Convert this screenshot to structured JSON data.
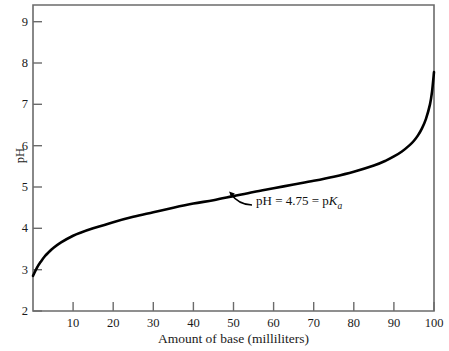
{
  "chart_data": {
    "type": "line",
    "title": "",
    "xlabel": "Amount of base (milliliters)",
    "ylabel": "pH",
    "xlim": [
      0,
      100
    ],
    "ylim": [
      2,
      9.4
    ],
    "grid": false,
    "legend": null,
    "xticks": [
      10,
      20,
      30,
      40,
      50,
      60,
      70,
      80,
      90,
      100
    ],
    "yticks": [
      2,
      3,
      4,
      5,
      6,
      7,
      8,
      9
    ],
    "xtick_labels": [
      "10",
      "20",
      "30",
      "40",
      "50",
      "60",
      "70",
      "80",
      "90",
      "100"
    ],
    "ytick_labels": [
      "2",
      "3",
      "4",
      "5",
      "6",
      "7",
      "8",
      "9"
    ],
    "series": [
      {
        "name": "titration-curve",
        "color": "#000000",
        "x": [
          0,
          1,
          2,
          3,
          4,
          5,
          7,
          10,
          12,
          15,
          20,
          25,
          30,
          35,
          40,
          45,
          50,
          55,
          60,
          65,
          70,
          75,
          80,
          85,
          88,
          90,
          92,
          94,
          95,
          96,
          97,
          98,
          99,
          99.5,
          100
        ],
        "y": [
          2.85,
          3.05,
          3.2,
          3.33,
          3.43,
          3.52,
          3.66,
          3.82,
          3.9,
          4.0,
          4.15,
          4.28,
          4.39,
          4.5,
          4.6,
          4.68,
          4.78,
          4.88,
          4.97,
          5.06,
          5.15,
          5.25,
          5.37,
          5.52,
          5.64,
          5.74,
          5.86,
          6.02,
          6.12,
          6.25,
          6.42,
          6.65,
          7.0,
          7.3,
          7.78
        ]
      }
    ],
    "annotations": [
      {
        "name": "pka-annotation",
        "text_plain": "pH = 4.75 = pKa",
        "text_before_k": "pH = 4.75 = p",
        "italic_symbol": "K",
        "subscript": "a",
        "point_x": 50,
        "point_y": 4.78
      }
    ]
  },
  "figure": {
    "background": "#ffffff",
    "axis_color": "#6b6b6b",
    "curve_color": "#000000"
  }
}
